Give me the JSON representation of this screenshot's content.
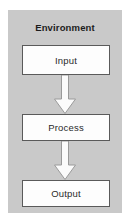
{
  "diagram": {
    "title": "Environment",
    "panel_color": "#c9c9c9",
    "box_fill_color": "#fdfdfd",
    "box_border_color": "#5a5a5a",
    "arrow_fill_color": "#fbfbfb",
    "arrow_border_color": "#9a9a9a",
    "text_color": "#1c1c1c",
    "nodes": [
      {
        "id": "input",
        "label": "Input"
      },
      {
        "id": "process",
        "label": "Process"
      },
      {
        "id": "output",
        "label": "Output"
      }
    ],
    "connectors": [
      {
        "id": "input-to-process",
        "from": "input",
        "to": "process",
        "shape": "block-arrow",
        "direction": "down"
      },
      {
        "id": "process-to-output",
        "from": "process",
        "to": "output",
        "shape": "block-arrow",
        "direction": "down"
      }
    ]
  }
}
